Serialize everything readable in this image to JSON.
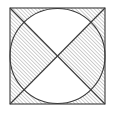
{
  "figure": {
    "canvas": {
      "width": 116,
      "height": 114,
      "background": "#ffffff"
    },
    "colors": {
      "stroke": "#3a3a3a",
      "hatch": "#8c8c8c",
      "fill_unhatched": "#ffffff",
      "background": "#ffffff"
    },
    "stroke_width": 1.1,
    "hatch": {
      "direction": "forward-slash",
      "angle_deg": 45,
      "spacing_px": 2.6,
      "line_width": 0.85,
      "color": "#8c8c8c"
    },
    "square": {
      "name": "outer-square",
      "x": 10,
      "y": 8,
      "width": 95,
      "height": 96,
      "label": "Square"
    },
    "circle": {
      "name": "inscribed-circle",
      "cx": 57.5,
      "cy": 56,
      "r": 47.5,
      "label": "Inscribed circle"
    },
    "diagonals": [
      {
        "name": "diagonal-tl-br",
        "x1": 10,
        "y1": 8,
        "x2": 105,
        "y2": 104,
        "label": "Diagonal top-left to bottom-right"
      },
      {
        "name": "diagonal-tr-bl",
        "x1": 105,
        "y1": 8,
        "x2": 10,
        "y2": 104,
        "label": "Diagonal top-right to bottom-left"
      }
    ],
    "regions": [
      {
        "name": "wedge-left",
        "label": "Left circular wedge",
        "shaded": true
      },
      {
        "name": "wedge-right",
        "label": "Right circular wedge",
        "shaded": true
      },
      {
        "name": "wedge-top",
        "label": "Top circular wedge",
        "shaded": false
      },
      {
        "name": "wedge-bottom",
        "label": "Bottom circular wedge",
        "shaded": false
      },
      {
        "name": "corner-top-left",
        "label": "Top-left corner outside circle",
        "shaded": true
      },
      {
        "name": "corner-top-right",
        "label": "Top-right corner outside circle",
        "shaded": true
      },
      {
        "name": "corner-bottom-left",
        "label": "Bottom-left corner outside circle",
        "shaded": true
      },
      {
        "name": "corner-bottom-right",
        "label": "Bottom-right corner outside circle",
        "shaded": true
      }
    ]
  }
}
